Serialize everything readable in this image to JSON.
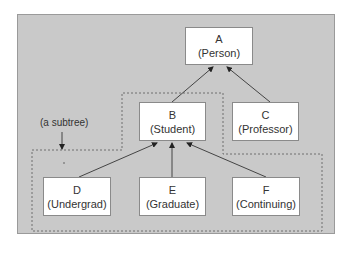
{
  "diagram": {
    "type": "class-hierarchy-tree",
    "colors": {
      "panel_background": "#c9c9c9",
      "panel_border": "#9a9a9a",
      "node_background": "#ffffff",
      "node_border": "#8a8a8a",
      "edge": "#444444",
      "dashed_outline": "#6e6e6e",
      "text": "#333333"
    },
    "nodes": [
      {
        "id": "A",
        "letter": "A",
        "name": "(Person)"
      },
      {
        "id": "B",
        "letter": "B",
        "name": "(Student)"
      },
      {
        "id": "C",
        "letter": "C",
        "name": "(Professor)"
      },
      {
        "id": "D",
        "letter": "D",
        "name": "(Undergrad)"
      },
      {
        "id": "E",
        "letter": "E",
        "name": "(Graduate)"
      },
      {
        "id": "F",
        "letter": "F",
        "name": "(Continuing)"
      }
    ],
    "edges": [
      {
        "from": "B",
        "to": "A"
      },
      {
        "from": "C",
        "to": "A"
      },
      {
        "from": "D",
        "to": "B"
      },
      {
        "from": "E",
        "to": "B"
      },
      {
        "from": "F",
        "to": "B"
      }
    ],
    "annotation": {
      "label": "(a subtree)",
      "points_to": "dashed region enclosing B, D, E, F"
    }
  }
}
